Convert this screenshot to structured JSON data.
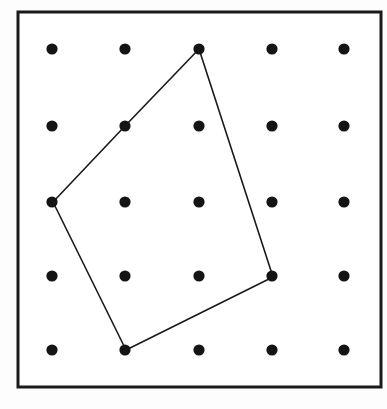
{
  "figure": {
    "canvas": {
      "width": 387,
      "height": 409,
      "background": "#fdfdfd"
    },
    "frame": {
      "name": "geoboard-frame",
      "x": 18,
      "y": 12,
      "width": 363,
      "height": 375,
      "stroke_color": "#1a1a1a",
      "stroke_width": 3,
      "fill_color": "#ffffff"
    },
    "grid": {
      "rows": 5,
      "cols": 5,
      "dot_color": "#141414",
      "dot_radius": 5.6,
      "col_x": [
        52,
        125,
        199,
        272,
        344
      ],
      "row_y": [
        49,
        126,
        202,
        276,
        350
      ],
      "points": [
        {
          "col": 1,
          "row": 1,
          "x": 52,
          "y": 49
        },
        {
          "col": 2,
          "row": 1,
          "x": 125,
          "y": 49
        },
        {
          "col": 3,
          "row": 1,
          "x": 199,
          "y": 49
        },
        {
          "col": 4,
          "row": 1,
          "x": 272,
          "y": 49
        },
        {
          "col": 5,
          "row": 1,
          "x": 344,
          "y": 49
        },
        {
          "col": 1,
          "row": 2,
          "x": 52,
          "y": 126
        },
        {
          "col": 2,
          "row": 2,
          "x": 125,
          "y": 126
        },
        {
          "col": 3,
          "row": 2,
          "x": 199,
          "y": 126
        },
        {
          "col": 4,
          "row": 2,
          "x": 272,
          "y": 126
        },
        {
          "col": 5,
          "row": 2,
          "x": 344,
          "y": 126
        },
        {
          "col": 1,
          "row": 3,
          "x": 52,
          "y": 202
        },
        {
          "col": 2,
          "row": 3,
          "x": 125,
          "y": 202
        },
        {
          "col": 3,
          "row": 3,
          "x": 199,
          "y": 202
        },
        {
          "col": 4,
          "row": 3,
          "x": 272,
          "y": 202
        },
        {
          "col": 5,
          "row": 3,
          "x": 344,
          "y": 202
        },
        {
          "col": 1,
          "row": 4,
          "x": 52,
          "y": 276
        },
        {
          "col": 2,
          "row": 4,
          "x": 125,
          "y": 276
        },
        {
          "col": 3,
          "row": 4,
          "x": 199,
          "y": 276
        },
        {
          "col": 4,
          "row": 4,
          "x": 272,
          "y": 276
        },
        {
          "col": 5,
          "row": 4,
          "x": 344,
          "y": 276
        },
        {
          "col": 1,
          "row": 5,
          "x": 52,
          "y": 350
        },
        {
          "col": 2,
          "row": 5,
          "x": 125,
          "y": 350
        },
        {
          "col": 3,
          "row": 5,
          "x": 199,
          "y": 350
        },
        {
          "col": 4,
          "row": 5,
          "x": 272,
          "y": 350
        },
        {
          "col": 5,
          "row": 5,
          "x": 344,
          "y": 350
        }
      ]
    },
    "polygon": {
      "name": "pentagon",
      "sides": 5,
      "closed": true,
      "stroke_color": "#1a1a1a",
      "stroke_width": 1.6,
      "fill": "none",
      "vertices": [
        {
          "label": "top",
          "grid_col": 3,
          "grid_row": 1,
          "x": 199,
          "y": 49
        },
        {
          "label": "right",
          "grid_col": 4,
          "grid_row": 4,
          "x": 273,
          "y": 277
        },
        {
          "label": "bottom",
          "grid_col": 2,
          "grid_row": 5,
          "x": 126,
          "y": 350
        },
        {
          "label": "left",
          "grid_col": 1,
          "grid_row": 3,
          "x": 53,
          "y": 202
        },
        {
          "label": "upper-left",
          "grid_col": 2,
          "grid_row": 2,
          "x": 125,
          "y": 126
        }
      ],
      "points_string": "199,49 273,277 126,350 53,202 125,126"
    }
  }
}
